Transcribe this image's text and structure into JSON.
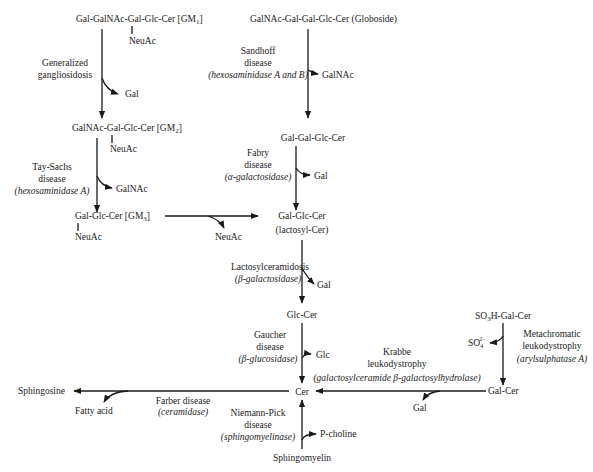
{
  "compounds": {
    "gm1": {
      "main": "Gal-GalNAc-Gal-Glc-Cer [GM",
      "sub": "1",
      "close": "]",
      "branch": "NeuAc"
    },
    "globoside": {
      "label": "GalNAc-Gal-Gal-Glc-Cer (Globoside)"
    },
    "gm2": {
      "main": "GalNAc-Gal-Glc-Cer [GM",
      "sub": "2",
      "close": "]",
      "branch": "NeuAc"
    },
    "trihexosyl": {
      "label": "Gal-Gal-Glc-Cer"
    },
    "gm3": {
      "main": "Gal-Glc-Cer [GM",
      "sub": "3",
      "close": "]",
      "branch": "NeuAc"
    },
    "lactosyl": {
      "line1": "Gal-Glc-Cer",
      "line2": "(lactosyl-Cer)"
    },
    "glccer": {
      "label": "Glc-Cer"
    },
    "cer": {
      "label": "Cer"
    },
    "sulfatide": {
      "pre": "SO",
      "sub": "3",
      "post": "H-Gal-Cer"
    },
    "galcer": {
      "label": "Gal-Cer"
    },
    "sphingosine": {
      "label": "Sphingosine"
    },
    "sphingomyelin": {
      "label": "Sphingomyelin"
    }
  },
  "diseases": {
    "generalized": {
      "line1": "Generalized",
      "line2": "gangliosidosis"
    },
    "sandhoff": {
      "line1": "Sandhoff",
      "line2": "disease",
      "enzyme": "(hexosaminidase A and B)"
    },
    "taysachs": {
      "line1": "Tay-Sachs",
      "line2": "disease",
      "enzyme": "(hexosaminidase A)"
    },
    "fabry": {
      "line1": "Fabry",
      "line2": "disease",
      "enzyme": "(α-galactosidase)"
    },
    "lactosylceramidosis": {
      "line1": "Lactosylceramidosis",
      "enzyme": "(β-galactosidase)"
    },
    "gaucher": {
      "line1": "Gaucher",
      "line2": "disease",
      "enzyme": "(β-glucosidase)"
    },
    "krabbe": {
      "line1": "Krabbe",
      "line2": "leukodystrophy",
      "enzyme": "(galactosylceramide β-galactosylhydrolase)"
    },
    "metachromatic": {
      "line1": "Metachromatic",
      "line2": "leukodystrophy",
      "enzyme": "(arylsulphatase A)"
    },
    "farber": {
      "line1": "Farber disease",
      "enzyme": "(ceramidase)"
    },
    "niemann": {
      "line1": "Niemann-Pick",
      "line2": "disease",
      "enzyme": "(sphingomyelinase)"
    }
  },
  "products": {
    "gm1_gal": "Gal",
    "globo_galnac": "GalNAc",
    "gm2_galnac": "GalNAc",
    "fabry_gal": "Gal",
    "gm3_neuac": "NeuAc",
    "lacto_gal": "Gal",
    "gaucher_glc": "Glc",
    "sulfate": {
      "pre": "SO",
      "sub": "4",
      "sup": "2−"
    },
    "krabbe_gal": "Gal",
    "fatty_acid": "Fatty acid",
    "pcholine": "P-choline"
  }
}
